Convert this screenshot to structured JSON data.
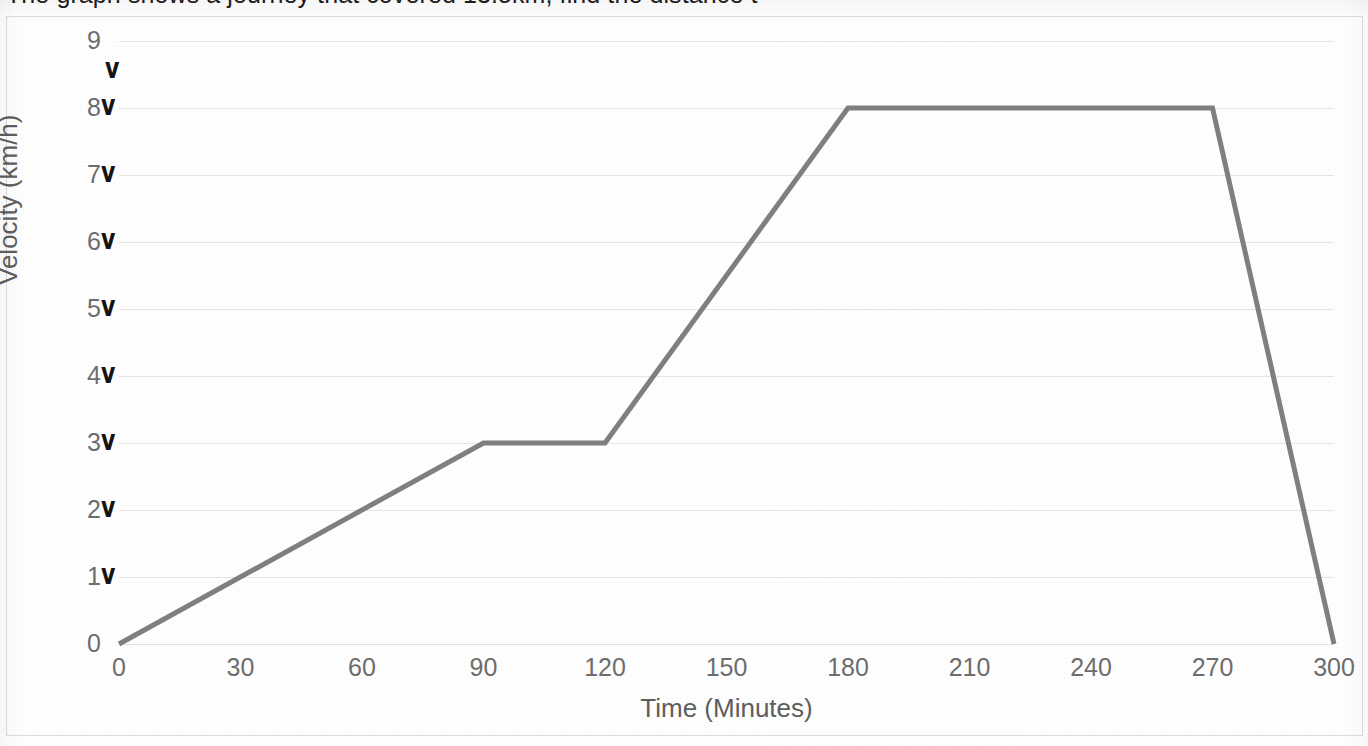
{
  "document": {
    "heading": "The graph shows a journey that covered 13.5km, find the distance t"
  },
  "chart_data": {
    "type": "line",
    "title": "",
    "xlabel": "Time (Minutes)",
    "ylabel": "Velocity (km/h)",
    "xlim": [
      0,
      300
    ],
    "ylim": [
      0,
      9
    ],
    "grid": true,
    "legend": "none",
    "line_color": "#808080",
    "line_width_px": 5,
    "x_ticks": [
      0,
      30,
      60,
      90,
      120,
      150,
      180,
      210,
      240,
      270,
      300
    ],
    "y_ticks": [
      0,
      1,
      2,
      3,
      4,
      5,
      6,
      7,
      8,
      9
    ],
    "x": [
      0,
      90,
      120,
      180,
      270,
      300
    ],
    "values": [
      0,
      3,
      3,
      8,
      8,
      0
    ],
    "points": [
      {
        "t": 0,
        "v": 0
      },
      {
        "t": 90,
        "v": 3
      },
      {
        "t": 120,
        "v": 3
      },
      {
        "t": 180,
        "v": 8
      },
      {
        "t": 270,
        "v": 8
      },
      {
        "t": 300,
        "v": 0
      }
    ]
  },
  "annotations": {
    "glyph": "v",
    "description": "handwritten tick marks beside y-axis labels",
    "marks": [
      {
        "label": "9",
        "value": 9,
        "offset": "above-right"
      },
      {
        "label": "8",
        "value": 8,
        "offset": "right"
      },
      {
        "label": "7",
        "value": 7,
        "offset": "right"
      },
      {
        "label": "6",
        "value": 6,
        "offset": "right"
      },
      {
        "label": "5",
        "value": 5,
        "offset": "right"
      },
      {
        "label": "4",
        "value": 4,
        "offset": "right"
      },
      {
        "label": "3",
        "value": 3,
        "offset": "right"
      },
      {
        "label": "2",
        "value": 2,
        "offset": "right"
      },
      {
        "label": "1",
        "value": 1,
        "offset": "right"
      }
    ]
  }
}
